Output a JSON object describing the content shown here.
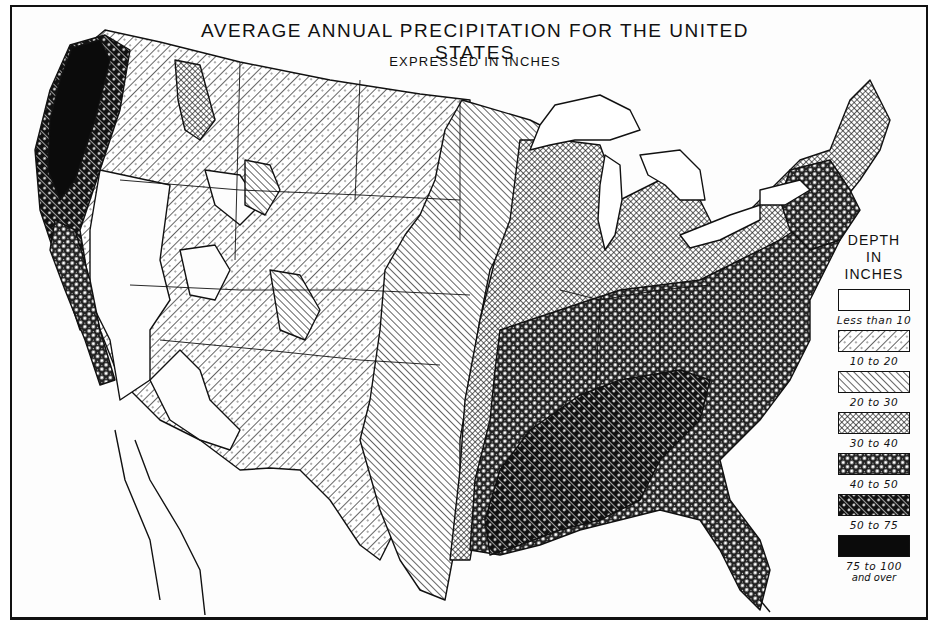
{
  "map": {
    "title": "AVERAGE ANNUAL PRECIPITATION FOR THE UNITED STATES",
    "subtitle": "EXPRESSED IN INCHES",
    "region": "Contiguous United States",
    "colors": {
      "ink": "#111111",
      "paper": "#fdfdfd"
    }
  },
  "legend": {
    "heading_lines": [
      "DEPTH",
      "IN",
      "INCHES"
    ],
    "items": [
      {
        "label": "Less than 10",
        "pattern": "blank"
      },
      {
        "label": "10 to 20",
        "pattern": "diagonal-dotted"
      },
      {
        "label": "20 to 30",
        "pattern": "diagonal-lines"
      },
      {
        "label": "30 to 40",
        "pattern": "crosshatch-fine"
      },
      {
        "label": "40 to 50",
        "pattern": "crosshatch-stars"
      },
      {
        "label": "50 to 75",
        "pattern": "heavy-diagonal-dotted"
      },
      {
        "label": "75 to 100",
        "sub": "and over",
        "pattern": "solid-black"
      }
    ]
  }
}
